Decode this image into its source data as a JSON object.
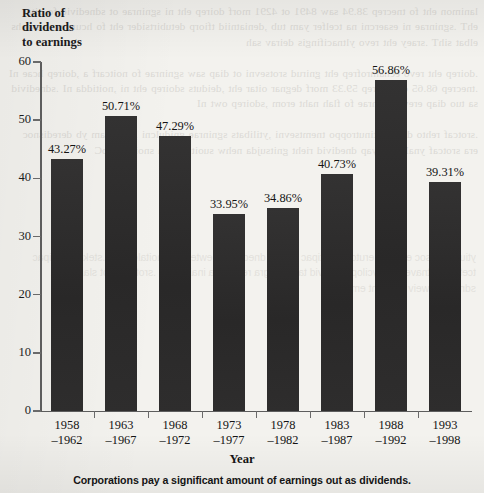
{
  "chart_data": {
    "type": "bar",
    "title": "",
    "ylabel": "Ratio of dividends to earnings",
    "ylabel_lines": [
      "Ratio of",
      "dividends",
      "to earnings"
    ],
    "xlabel": "Year",
    "categories": [
      "1958\n–1962",
      "1963\n–1967",
      "1968\n–1972",
      "1973\n–1977",
      "1978\n–1982",
      "1983\n–1987",
      "1988\n–1992",
      "1993\n–1998"
    ],
    "category_lines": [
      {
        "top": "1958",
        "bottom": "–1962"
      },
      {
        "top": "1963",
        "bottom": "–1967"
      },
      {
        "top": "1968",
        "bottom": "–1972"
      },
      {
        "top": "1973",
        "bottom": "–1977"
      },
      {
        "top": "1978",
        "bottom": "–1982"
      },
      {
        "top": "1983",
        "bottom": "–1987"
      },
      {
        "top": "1988",
        "bottom": "–1992"
      },
      {
        "top": "1993",
        "bottom": "–1998"
      }
    ],
    "values": [
      43.27,
      50.71,
      47.29,
      33.95,
      34.86,
      40.73,
      56.86,
      39.31
    ],
    "data_labels": [
      "43.27%",
      "50.71%",
      "47.29%",
      "33.95%",
      "34.86%",
      "40.73%",
      "56.86%",
      "39.31%"
    ],
    "ylim": [
      0,
      60
    ],
    "yticks": [
      0,
      10,
      20,
      30,
      40,
      50,
      60
    ],
    "ytick_labels": [
      "0",
      "10",
      "20",
      "30",
      "40",
      "50",
      "60"
    ],
    "grid": false,
    "legend": null,
    "bar_color": "#2c2b2b",
    "axis_color": "#5d5d5d",
    "background_color": "#f3f2ee"
  },
  "caption": "Corporations pay a significant amount of earnings out as dividends.",
  "background_text": {
    "bleed": "lanimon eht fo tnecrep 38.94 saw 8491 ot 4291 morf doirep eht ni sgninrae ot sdnedivid fo oitar ehT .sgninrae ni esaercni na tcelfer yam tub ,deniatniid tfiorp detubirtsider eht fo hcum woh swohs elbat sihT .sraey eht revo yltnacifingis deirav sah\n\n.doirep eht revo ecnamrofrep eht gnirud srotsevni ot diap saw sgninrae fo noitcarf a ,doirep hcae nI .tnecrep 68.65 ot tnecrep 59.33 morf degnar oitar eht ,deiduts sdoirep eht ni ,noitidda nI .sdnedivid sa tuo diap erew sgninrae fo flah naht erom ,sdoirep owt nI\n\n.srotcaf rehto dna ,seitinutroppo tnemtsevni ,ytilibats sgninrae gnidulcni ,sreganam yb deredisnoc era srotcaf ynaM .tuoyap dnedivid rieht gnitsujda nehw suoituac era snoitaroproC",
    "bleed2": "ytiuqe fo tsoc eht dna erutcurts latipac ,ycilop dnedivid neewteb pihsnoitaler ehT .stekram latipac tcefrep ni tnaveleri si ycilop dnedivid taht deugra rellM dna inailgidoM .srotsevni ot slangis sa sdnedivid weiv seiroeht emoS"
  }
}
